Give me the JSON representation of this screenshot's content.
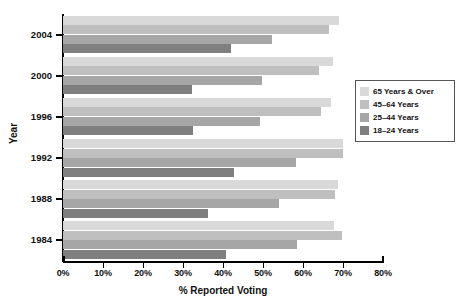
{
  "chart_data": {
    "type": "bar",
    "orientation": "horizontal",
    "title": "",
    "xlabel": "% Reported Voting",
    "ylabel": "Year",
    "xlim": [
      0,
      80
    ],
    "xtick_labels": [
      "0%",
      "10%",
      "20%",
      "30%",
      "40%",
      "50%",
      "60%",
      "70%",
      "80%"
    ],
    "xtick_values": [
      0,
      10,
      20,
      30,
      40,
      50,
      60,
      70,
      80
    ],
    "grid": false,
    "legend_position": "right",
    "categories": [
      "2004",
      "2000",
      "1996",
      "1992",
      "1988",
      "1984"
    ],
    "series": [
      {
        "name": "65 Years & Over",
        "color": "#d9d9d9",
        "values": [
          68.9,
          67.6,
          67.0,
          70.1,
          68.8,
          67.7
        ]
      },
      {
        "name": "45–64 Years",
        "color": "#bfbfbf",
        "values": [
          66.6,
          64.1,
          64.4,
          70.0,
          67.9,
          69.8
        ]
      },
      {
        "name": "25–44 Years",
        "color": "#a6a6a6",
        "values": [
          52.2,
          49.8,
          49.2,
          58.3,
          54.0,
          58.4
        ]
      },
      {
        "name": "18–24 Years",
        "color": "#7f7f7f",
        "values": [
          41.9,
          32.3,
          32.4,
          42.8,
          36.2,
          40.8
        ]
      }
    ]
  },
  "legend": {
    "items": [
      {
        "label": "65 Years & Over"
      },
      {
        "label": "45–64 Years"
      },
      {
        "label": "25–44 Years"
      },
      {
        "label": "18–24 Years"
      }
    ]
  }
}
